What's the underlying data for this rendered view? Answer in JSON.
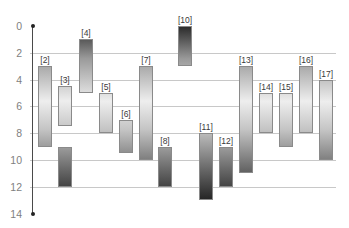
{
  "chart_data": {
    "type": "bar",
    "subtype": "floating-range",
    "title": "",
    "xlabel": "",
    "ylabel": "",
    "y_axis_inverted": true,
    "ylim": [
      0,
      14
    ],
    "yticks": [
      "0",
      "2",
      "4",
      "6",
      "8",
      "10",
      "12",
      "14"
    ],
    "grid": true,
    "legend": null,
    "gradient": {
      "top": "#2c2c2c",
      "middle": "#eeeeee",
      "bottom": "#1c1c1c"
    },
    "bars": [
      {
        "label": "[2]",
        "start": 3,
        "end": 9
      },
      {
        "label": "[3]",
        "start": 4.5,
        "end": 7.5
      },
      {
        "label": "",
        "start": 9,
        "end": 12
      },
      {
        "label": "[4]",
        "start": 1,
        "end": 5
      },
      {
        "label": "[5]",
        "start": 5,
        "end": 8
      },
      {
        "label": "[6]",
        "start": 7,
        "end": 9.5
      },
      {
        "label": "[7]",
        "start": 3,
        "end": 10
      },
      {
        "label": "[8]",
        "start": 9,
        "end": 12
      },
      {
        "label": "[10]",
        "start": 0,
        "end": 3
      },
      {
        "label": "[11]",
        "start": 8,
        "end": 13
      },
      {
        "label": "[12]",
        "start": 9,
        "end": 12
      },
      {
        "label": "[13]",
        "start": 3,
        "end": 11
      },
      {
        "label": "[14]",
        "start": 5,
        "end": 8
      },
      {
        "label": "[15]",
        "start": 5,
        "end": 9
      },
      {
        "label": "[16]",
        "start": 3,
        "end": 8
      },
      {
        "label": "[17]",
        "start": 4,
        "end": 10
      }
    ],
    "bar_slots": [
      38,
      58,
      58,
      79,
      99,
      119,
      139,
      158,
      178,
      199,
      219,
      239,
      259,
      279,
      299,
      319
    ]
  }
}
